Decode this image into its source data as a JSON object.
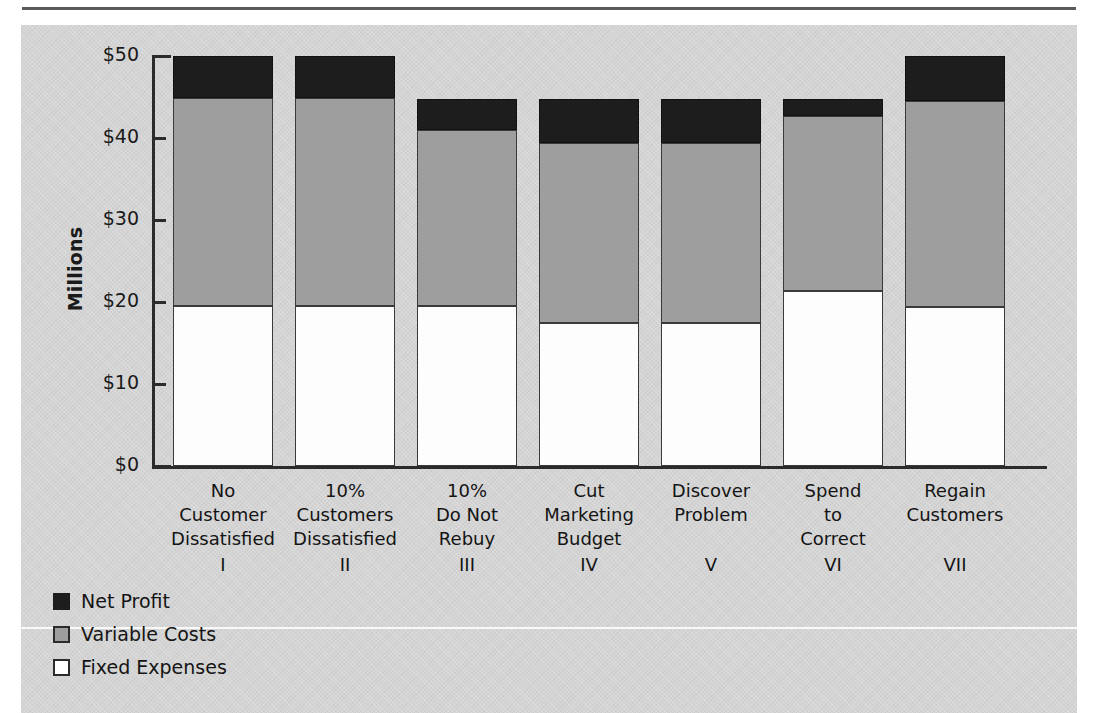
{
  "chart_data": {
    "type": "bar",
    "subtype": "stacked-bar",
    "title": "",
    "xlabel": "",
    "ylabel": "Millions",
    "ylim": [
      0,
      50
    ],
    "ytick_values": [
      0,
      10,
      20,
      30,
      40,
      50
    ],
    "ytick_labels": [
      "$0",
      "$10",
      "$20",
      "$30",
      "$40",
      "$50"
    ],
    "grid": false,
    "legend_position": "bottom-left",
    "categories": [
      {
        "lines": [
          "No",
          "Customer",
          "Dissatisfied"
        ],
        "roman": "I"
      },
      {
        "lines": [
          "10%",
          "Customers",
          "Dissatisfied"
        ],
        "roman": "II"
      },
      {
        "lines": [
          "10%",
          "Do Not",
          "Rebuy"
        ],
        "roman": "III"
      },
      {
        "lines": [
          "Cut",
          "Marketing",
          "Budget"
        ],
        "roman": "IV"
      },
      {
        "lines": [
          "Discover",
          "Problem"
        ],
        "roman": "V"
      },
      {
        "lines": [
          "Spend",
          "to",
          "Correct"
        ],
        "roman": "VI"
      },
      {
        "lines": [
          "Regain",
          "Customers"
        ],
        "roman": "VII"
      }
    ],
    "series": [
      {
        "name": "Fixed Expenses",
        "color": "#ffffff",
        "values": [
          19.5,
          19.5,
          19.5,
          17.5,
          17.5,
          21.3,
          19.4
        ]
      },
      {
        "name": "Variable Costs",
        "color": "#9e9e9e",
        "values": [
          25.4,
          25.4,
          21.5,
          21.9,
          21.9,
          21.4,
          25.1
        ]
      },
      {
        "name": "Net Profit",
        "color": "#1d1d1d",
        "values": [
          5.1,
          5.1,
          3.7,
          5.3,
          5.3,
          2.0,
          5.5
        ]
      }
    ],
    "totals": [
      50.0,
      50.0,
      44.7,
      44.7,
      44.7,
      44.7,
      50.0
    ]
  },
  "legend": {
    "items": [
      {
        "label": "Net Profit",
        "swatch": "black-swatch"
      },
      {
        "label": "Variable Costs",
        "swatch": "gray-swatch"
      },
      {
        "label": "Fixed Expenses",
        "swatch": "white-swatch"
      }
    ]
  }
}
